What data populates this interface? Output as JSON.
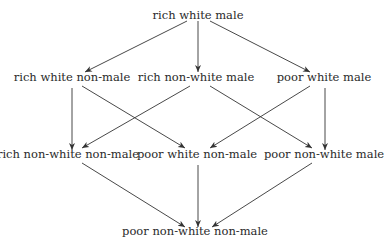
{
  "diagram": {
    "type": "lattice",
    "nodes": [
      {
        "id": "rwm",
        "label": "rich white male",
        "x": 198,
        "y": 8
      },
      {
        "id": "rwn",
        "label": "rich white non-male",
        "x": 72,
        "y": 70
      },
      {
        "id": "rnm",
        "label": "rich non-white male",
        "x": 196,
        "y": 70
      },
      {
        "id": "pwm",
        "label": "poor white male",
        "x": 324,
        "y": 70
      },
      {
        "id": "rnn",
        "label": "rich non-white non-male",
        "x": 68,
        "y": 147
      },
      {
        "id": "pwn",
        "label": "poor white non-male",
        "x": 197,
        "y": 147
      },
      {
        "id": "pnm",
        "label": "poor non-white male",
        "x": 324,
        "y": 147
      },
      {
        "id": "pnn",
        "label": "poor non-white non-male",
        "x": 195,
        "y": 224
      }
    ],
    "edges": [
      {
        "from": "rich white male",
        "to": "rich white non-male",
        "x1": 187,
        "y1": 21,
        "x2": 85,
        "y2": 72
      },
      {
        "from": "rich white male",
        "to": "rich non-white male",
        "x1": 198,
        "y1": 21,
        "x2": 198,
        "y2": 72
      },
      {
        "from": "rich white male",
        "to": "poor white male",
        "x1": 210,
        "y1": 21,
        "x2": 310,
        "y2": 72
      },
      {
        "from": "rich white non-male",
        "to": "rich non-white non-male",
        "x1": 72,
        "y1": 88,
        "x2": 72,
        "y2": 150
      },
      {
        "from": "rich white non-male",
        "to": "poor white non-male",
        "x1": 82,
        "y1": 86,
        "x2": 185,
        "y2": 148
      },
      {
        "from": "rich non-white male",
        "to": "rich non-white non-male",
        "x1": 190,
        "y1": 86,
        "x2": 82,
        "y2": 148
      },
      {
        "from": "rich non-white male",
        "to": "poor non-white male",
        "x1": 210,
        "y1": 86,
        "x2": 312,
        "y2": 148
      },
      {
        "from": "poor white male",
        "to": "poor white non-male",
        "x1": 310,
        "y1": 86,
        "x2": 210,
        "y2": 148
      },
      {
        "from": "poor white male",
        "to": "poor non-white male",
        "x1": 325,
        "y1": 88,
        "x2": 325,
        "y2": 150
      },
      {
        "from": "rich non-white non-male",
        "to": "poor non-white non-male",
        "x1": 82,
        "y1": 163,
        "x2": 185,
        "y2": 227
      },
      {
        "from": "poor white non-male",
        "to": "poor non-white non-male",
        "x1": 198,
        "y1": 165,
        "x2": 198,
        "y2": 227
      },
      {
        "from": "poor non-white male",
        "to": "poor non-white non-male",
        "x1": 312,
        "y1": 163,
        "x2": 212,
        "y2": 227
      }
    ],
    "colors": {
      "line": "#333333",
      "text": "#2a2a2a",
      "background": "#ffffff"
    }
  }
}
